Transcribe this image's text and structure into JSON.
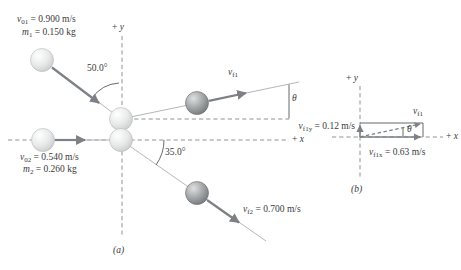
{
  "colors": {
    "text": "#3a3a3a",
    "arrow": "#7d8185",
    "thin-line": "#b4b7ba",
    "dashed-line": "#8e9296",
    "angle-line": "#55585a"
  },
  "panel_a": {
    "caption": "(a)",
    "y_axis": {
      "pre": "+ ",
      "sym": "y"
    },
    "x_axis": {
      "pre": "+ ",
      "sym": "x"
    },
    "ball1": {
      "velocity": {
        "sym": "v",
        "sub": "01",
        "val": " = 0.900 m/s"
      },
      "mass": {
        "sym": "m",
        "sub": "1",
        "val": " = 0.150 kg"
      }
    },
    "ball2": {
      "velocity": {
        "sym": "v",
        "sub": "02",
        "val": " = 0.540 m/s"
      },
      "mass": {
        "sym": "m",
        "sub": "2",
        "val": " = 0.260 kg"
      }
    },
    "incoming_angle": "50.0°",
    "outgoing_angle": "35.0°",
    "vf1": {
      "sym": "v",
      "sub": "f1"
    },
    "vf2": {
      "sym": "v",
      "sub": "f2",
      "val": " = 0.700 m/s"
    },
    "theta": "θ"
  },
  "panel_b": {
    "caption": "(b)",
    "y_axis": {
      "pre": "+ ",
      "sym": "y"
    },
    "x_axis": {
      "pre": "+ ",
      "sym": "x"
    },
    "vf1": {
      "sym": "v",
      "sub": "f1"
    },
    "vf1y": {
      "sym": "v",
      "sub": "f1y",
      "val": " = 0.12 m/s"
    },
    "vf1x": {
      "sym": "v",
      "sub": "f1x",
      "val": " = 0.63 m/s"
    },
    "theta": "θ"
  }
}
